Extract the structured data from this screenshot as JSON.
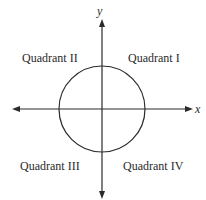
{
  "diagram": {
    "type": "coordinate-plane",
    "axes": {
      "x_label": "x",
      "y_label": "y"
    },
    "quadrants": [
      {
        "id": "I",
        "label": "Quadrant I"
      },
      {
        "id": "II",
        "label": "Quadrant II"
      },
      {
        "id": "III",
        "label": "Quadrant III"
      },
      {
        "id": "IV",
        "label": "Quadrant IV"
      }
    ],
    "shape": "circle centered at origin",
    "colors": {
      "stroke": "#2a2a2a",
      "background": "#ffffff"
    }
  }
}
